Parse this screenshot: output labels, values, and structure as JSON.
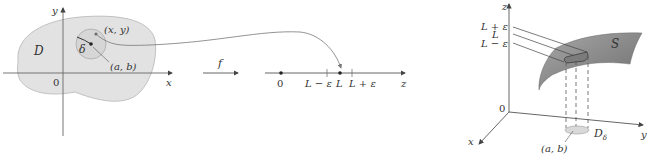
{
  "left_panel": {
    "axis_x": "x",
    "axis_y": "y",
    "origin": "0",
    "region": "D",
    "radius": "δ",
    "point_xy": "(x, y)",
    "point_ab": "(a, b)"
  },
  "mapping": {
    "function": "f"
  },
  "number_line": {
    "origin": "0",
    "lower": "L − ε",
    "center": "L",
    "upper": "L + ε",
    "axis": "z"
  },
  "right_panel": {
    "axis_x": "x",
    "axis_y": "y",
    "axis_z": "z",
    "origin": "0",
    "surface": "S",
    "level_upper": "L + ε",
    "level_center": "L",
    "level_lower": "L − ε",
    "disk": "D",
    "disk_sub": "δ",
    "point_ab": "(a, b)"
  },
  "colors": {
    "region_fill": "#e2e2e2",
    "surface_fill": "#8c8c8c",
    "line": "#555555"
  }
}
